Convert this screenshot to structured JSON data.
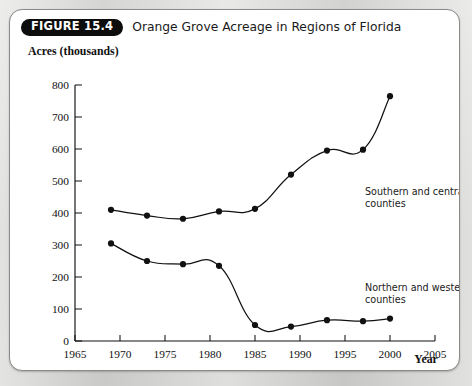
{
  "figure": {
    "badge": "FIGURE 15.4",
    "caption": "Orange Grove Acreage in Regions of Florida"
  },
  "chart_data": {
    "type": "line",
    "title": "Orange Grove Acreage in Regions of Florida",
    "xlabel": "Year",
    "ylabel": "Acres (thousands)",
    "xlim": [
      1965,
      2005
    ],
    "ylim": [
      0,
      800
    ],
    "xticks": [
      1965,
      1970,
      1975,
      1980,
      1985,
      1990,
      1995,
      2000,
      2005
    ],
    "yticks": [
      0,
      100,
      200,
      300,
      400,
      500,
      600,
      700,
      800
    ],
    "grid": false,
    "legend": "annotations",
    "x": [
      1969,
      1973,
      1977,
      1981,
      1985,
      1989,
      1993,
      1997,
      2000
    ],
    "series": [
      {
        "name": "Southern and central counties",
        "label_line1": "Southern and central",
        "label_line2": "counties",
        "values": [
          410,
          392,
          382,
          405,
          413,
          520,
          595,
          598,
          765
        ]
      },
      {
        "name": "Northern and western counties",
        "label_line1": "Northern and western",
        "label_line2": "counties",
        "values": [
          305,
          250,
          240,
          235,
          50,
          45,
          65,
          62,
          70
        ]
      }
    ]
  },
  "colors": {
    "line": "#111111",
    "marker": "#111111",
    "card": "#ffffff",
    "page": "#cfcfcd",
    "badge_bg": "#0d0d0d",
    "badge_text": "#ffffff"
  }
}
